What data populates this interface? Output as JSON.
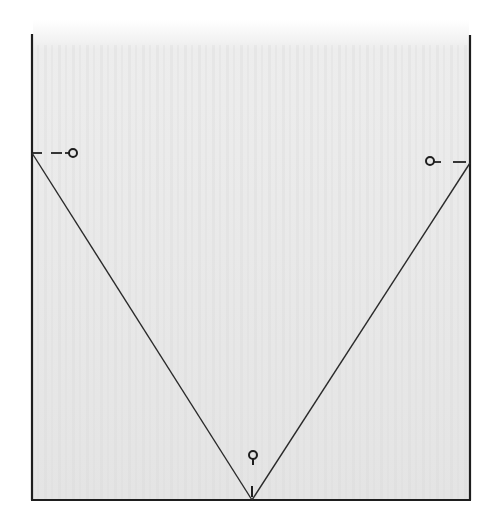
{
  "diagram": {
    "colors": {
      "background": "#ffffff",
      "shading": "#e6e6e6",
      "line": "#1e1e1e"
    },
    "box": {
      "left": 32,
      "right": 470,
      "top": 34,
      "bottom": 500
    },
    "v_shape": {
      "left_end": [
        32,
        153
      ],
      "apex": [
        252,
        500
      ],
      "right_end": [
        470,
        163
      ]
    },
    "pins": [
      {
        "id": "left",
        "center": [
          73,
          153
        ],
        "radius": 4,
        "dash_from": [
          32,
          153
        ],
        "dash_to": [
          67,
          153
        ]
      },
      {
        "id": "right",
        "center": [
          431,
          161
        ],
        "radius": 4,
        "dash_from": [
          437,
          162
        ],
        "dash_to": [
          470,
          162
        ]
      },
      {
        "id": "bottom",
        "center": [
          253,
          455
        ],
        "radius": 4,
        "stem_to": [
          253,
          464
        ],
        "tick_from": [
          252,
          486
        ],
        "tick_to": [
          252,
          497
        ]
      }
    ]
  }
}
